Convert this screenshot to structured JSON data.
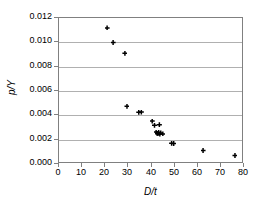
{
  "chart_data": {
    "type": "scatter",
    "title": "",
    "xlabel": "D/t",
    "ylabel": "p/Y",
    "xlim": [
      0,
      80
    ],
    "ylim": [
      0,
      0.012
    ],
    "xticks": [
      "0",
      "10",
      "20",
      "30",
      "40",
      "50",
      "60",
      "70",
      "80"
    ],
    "xtick_values": [
      0,
      10,
      20,
      30,
      40,
      50,
      60,
      70,
      80
    ],
    "yticks": [
      "0.000",
      "0.002",
      "0.004",
      "0.006",
      "0.008",
      "0.010",
      "0.012"
    ],
    "ytick_values": [
      0,
      0.002,
      0.004,
      0.006,
      0.008,
      0.01,
      0.012
    ],
    "grid": "horizontal",
    "legend": "none",
    "marker": "filled-diamond",
    "marker_color": "#000000",
    "series": [
      {
        "name": "p/Y vs D/t",
        "points": [
          {
            "x": 20.8,
            "y": 0.01118
          },
          {
            "x": 23.4,
            "y": 0.00999
          },
          {
            "x": 28.5,
            "y": 0.00911
          },
          {
            "x": 29.4,
            "y": 0.00475
          },
          {
            "x": 34.5,
            "y": 0.00425
          },
          {
            "x": 35.6,
            "y": 0.00427
          },
          {
            "x": 40.3,
            "y": 0.00353
          },
          {
            "x": 41.3,
            "y": 0.00318
          },
          {
            "x": 42.0,
            "y": 0.00262
          },
          {
            "x": 42.4,
            "y": 0.00253
          },
          {
            "x": 42.8,
            "y": 0.00249
          },
          {
            "x": 43.1,
            "y": 0.00261
          },
          {
            "x": 43.4,
            "y": 0.00322
          },
          {
            "x": 43.6,
            "y": 0.00246
          },
          {
            "x": 44.0,
            "y": 0.00255
          },
          {
            "x": 44.9,
            "y": 0.00247
          },
          {
            "x": 48.7,
            "y": 0.00171
          },
          {
            "x": 49.6,
            "y": 0.00168
          },
          {
            "x": 62.3,
            "y": 0.00111
          },
          {
            "x": 76.1,
            "y": 0.0007
          }
        ]
      }
    ]
  }
}
